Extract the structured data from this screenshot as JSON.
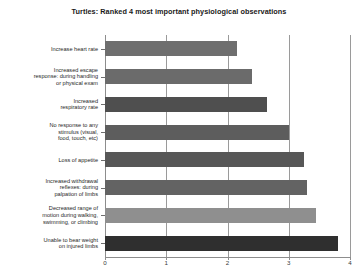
{
  "chart_data": {
    "type": "bar",
    "orientation": "horizontal",
    "title": "Turtles: Ranked 4 most important physiological observations",
    "xlabel": "",
    "ylabel": "",
    "xlim": [
      0,
      4
    ],
    "xticks": [
      "0",
      "1",
      "2",
      "3",
      "4"
    ],
    "grid": true,
    "legend": false,
    "categories": [
      "Increase heart rate",
      "Increased escape response: during handling or physical exam",
      "Increased respiratory rate",
      "No response to any stimulus (visual, food, touch, etc)",
      "Loss of appetite",
      "Increased withdrawal reflexes: during palpation of limbs",
      "Decreased range of motion during walking, swimming, or climbing",
      "Unable to bear weight on injured limbs"
    ],
    "category_lines": [
      [
        "Increase heart rate"
      ],
      [
        "Increased escape",
        "response: during handling",
        "or physical exam"
      ],
      [
        "Increased",
        "respiratory rate"
      ],
      [
        "No response to any",
        "stimulus (visual,",
        "food, touch, etc)"
      ],
      [
        "Loss of appetite"
      ],
      [
        "Increased withdrawal",
        "reflexes: during",
        "palpation of limbs"
      ],
      [
        "Decreased range of",
        "motion during walking,",
        "swimming, or climbing"
      ],
      [
        "Unable to bear weight",
        "on injured limbs"
      ]
    ],
    "values": [
      2.15,
      2.4,
      2.65,
      3.0,
      3.25,
      3.3,
      3.45,
      3.8
    ],
    "bar_colors": [
      "#6e6e6e",
      "#6b6b6b",
      "#4f4f4f",
      "#5d5d5d",
      "#575757",
      "#636363",
      "#8f8f8f",
      "#2f2f2f"
    ]
  }
}
